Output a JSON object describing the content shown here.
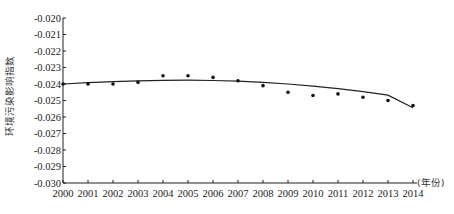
{
  "chart_data": {
    "type": "scatter",
    "title": "",
    "xlabel": "(年份)",
    "ylabel": "环境污染影响指数",
    "x": [
      2000,
      2001,
      2002,
      2003,
      2004,
      2005,
      2006,
      2007,
      2008,
      2009,
      2010,
      2011,
      2012,
      2013,
      2014
    ],
    "xticks": [
      "2000",
      "2001",
      "2002",
      "2003",
      "2004",
      "2005",
      "2006",
      "2007",
      "2008",
      "2009",
      "2010",
      "2011",
      "2012",
      "2013",
      "2014"
    ],
    "yticks": [
      "-0.020",
      "-0.021",
      "-0.022",
      "-0.023",
      "-0.024",
      "-0.025",
      "-0.026",
      "-0.027",
      "-0.028",
      "-0.029",
      "-0.030"
    ],
    "ylim": [
      -0.03,
      -0.02
    ],
    "xlim": [
      2000,
      2014
    ],
    "grid": false,
    "series": [
      {
        "name": "observed",
        "kind": "scatter",
        "values": [
          -0.024,
          -0.024,
          -0.024,
          -0.0239,
          -0.0235,
          -0.0235,
          -0.0236,
          -0.0238,
          -0.0241,
          -0.0245,
          -0.0247,
          -0.0246,
          -0.0248,
          -0.025,
          -0.0253
        ]
      },
      {
        "name": "trend",
        "kind": "line",
        "values": [
          -0.024,
          -0.02392,
          -0.02386,
          -0.02381,
          -0.02378,
          -0.02377,
          -0.02379,
          -0.02383,
          -0.0239,
          -0.024,
          -0.02413,
          -0.02428,
          -0.02446,
          -0.02468,
          -0.02544
        ]
      }
    ]
  }
}
